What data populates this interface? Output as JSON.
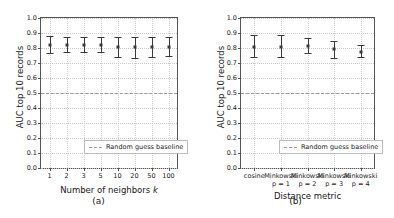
{
  "figure": {
    "panels": [
      {
        "caption": "(a)"
      },
      {
        "caption": "(b)"
      }
    ]
  },
  "chart_data": [
    {
      "type": "scatter",
      "title": "",
      "xlabel": "Number of neighbors k",
      "xlabel_plain": "Number of neighbors",
      "xlabel_italic": "k",
      "ylabel": "AUC top 10 records",
      "ylim": [
        0.0,
        1.0
      ],
      "yticks": [
        "0.0",
        "0.1",
        "0.2",
        "0.3",
        "0.4",
        "0.5",
        "0.6",
        "0.7",
        "0.8",
        "0.9",
        "1.0"
      ],
      "categories": [
        "1",
        "2",
        "3",
        "5",
        "10",
        "20",
        "50",
        "100"
      ],
      "values": [
        0.818,
        0.818,
        0.817,
        0.818,
        0.806,
        0.806,
        0.807,
        0.809
      ],
      "err_low": [
        0.048,
        0.043,
        0.042,
        0.043,
        0.064,
        0.07,
        0.066,
        0.062
      ],
      "err_high": [
        0.062,
        0.058,
        0.057,
        0.058,
        0.066,
        0.068,
        0.067,
        0.066
      ],
      "baseline": 0.5,
      "baseline_label": "Random guess baseline",
      "legend_position": "lower right",
      "grid": true,
      "caption": "(a)"
    },
    {
      "type": "scatter",
      "title": "",
      "xlabel": "Distance metric",
      "ylabel": "AUC top 10 records",
      "ylim": [
        0.0,
        1.0
      ],
      "yticks": [
        "0.0",
        "0.1",
        "0.2",
        "0.3",
        "0.4",
        "0.5",
        "0.6",
        "0.7",
        "0.8",
        "0.9",
        "1.0"
      ],
      "categories": [
        "cosine",
        "Minkowski p = 1",
        "Minkowski p = 2",
        "Minkowski p = 3",
        "Minkowski p = 4"
      ],
      "category_lines": [
        {
          "l1": "cosine",
          "l2": ""
        },
        {
          "l1": "Minkowski",
          "l2": "p = 1"
        },
        {
          "l1": "Minkowski",
          "l2": "p = 2"
        },
        {
          "l1": "Minkowski",
          "l2": "p = 3"
        },
        {
          "l1": "Minkowski",
          "l2": "p = 4"
        }
      ],
      "values": [
        0.805,
        0.81,
        0.815,
        0.792,
        0.775
      ],
      "err_low": [
        0.063,
        0.072,
        0.05,
        0.06,
        0.038
      ],
      "err_high": [
        0.08,
        0.075,
        0.055,
        0.058,
        0.042
      ],
      "baseline": 0.5,
      "baseline_label": "Random guess baseline",
      "legend_position": "lower right",
      "grid": true,
      "caption": "(b)"
    }
  ]
}
